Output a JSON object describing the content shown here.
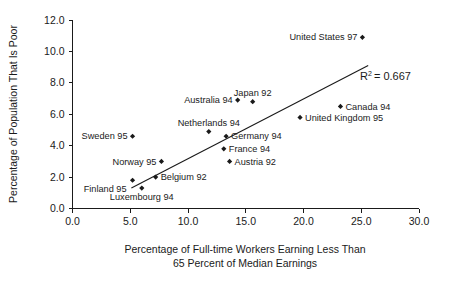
{
  "chart_data": {
    "type": "scatter",
    "title": "",
    "xlabel": "Percentage of Full-time Workers Earning Less Than 65 Percent of Median Earnings",
    "xlabel_line1": "Percentage of Full-time Workers Earning Less Than",
    "xlabel_line2": "65 Percent of Median Earnings",
    "ylabel": "Percentage of Population That Is Poor",
    "xlim": [
      0.0,
      30.0
    ],
    "ylim": [
      0.0,
      12.0
    ],
    "xticks": [
      "0.0",
      "5.0",
      "10.0",
      "15.0",
      "20.0",
      "25.0",
      "30.0"
    ],
    "xtick_values": [
      0.0,
      5.0,
      10.0,
      15.0,
      20.0,
      25.0,
      30.0
    ],
    "yticks": [
      "0.0",
      "2.0",
      "4.0",
      "6.0",
      "8.0",
      "10.0",
      "12.0"
    ],
    "ytick_values": [
      0.0,
      2.0,
      4.0,
      6.0,
      8.0,
      10.0,
      12.0
    ],
    "grid": false,
    "legend": false,
    "marker_color": "#1a1a1a",
    "line_color": "#1a1a1a",
    "annotation": {
      "text": "R2 = 0.667",
      "r_symbol": "R",
      "superscript": "2",
      "equals_value": "= 0.667",
      "value": 0.667,
      "x": 24.9,
      "y": 8.2
    },
    "trendline": {
      "x_start": 5.1,
      "y_start": 1.3,
      "x_end": 25.6,
      "y_end": 9.1
    },
    "points": [
      {
        "label": "United States 97",
        "x": 25.1,
        "y": 10.9,
        "label_pos": "left"
      },
      {
        "label": "Australia 94",
        "x": 14.3,
        "y": 6.9,
        "label_pos": "left"
      },
      {
        "label": "Japan 92",
        "x": 15.6,
        "y": 6.8,
        "label_pos": "above"
      },
      {
        "label": "Canada 94",
        "x": 23.2,
        "y": 6.5,
        "label_pos": "right"
      },
      {
        "label": "United Kingdom 95",
        "x": 19.7,
        "y": 5.8,
        "label_pos": "right"
      },
      {
        "label": "Netherlands 94",
        "x": 11.8,
        "y": 4.9,
        "label_pos": "above"
      },
      {
        "label": "Sweden 95",
        "x": 5.2,
        "y": 4.6,
        "label_pos": "left"
      },
      {
        "label": "Germany 94",
        "x": 13.3,
        "y": 4.6,
        "label_pos": "right"
      },
      {
        "label": "France 94",
        "x": 13.1,
        "y": 3.8,
        "label_pos": "right"
      },
      {
        "label": "Austria 92",
        "x": 13.6,
        "y": 3.0,
        "label_pos": "right"
      },
      {
        "label": "Norway 95",
        "x": 7.7,
        "y": 3.0,
        "label_pos": "left"
      },
      {
        "label": "Belgium 92",
        "x": 7.2,
        "y": 2.0,
        "label_pos": "right"
      },
      {
        "label": "Finland 95",
        "x": 5.2,
        "y": 1.8,
        "label_pos": "below-left"
      },
      {
        "label": "Luxembourg 94",
        "x": 6.0,
        "y": 1.3,
        "label_pos": "below"
      }
    ]
  }
}
